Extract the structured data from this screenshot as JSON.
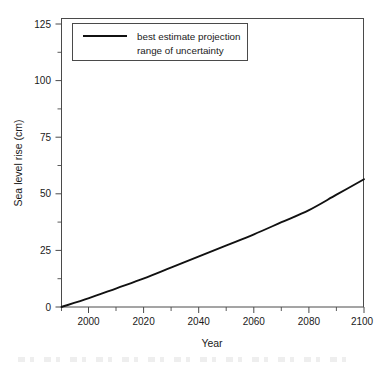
{
  "figure": {
    "background_color": "#ffffff",
    "line_color": "#111111",
    "axis_color": "#4a4a4a"
  },
  "chart_data": {
    "type": "line",
    "title": "",
    "xlabel": "Year",
    "ylabel": "Sea level rise (cm)",
    "xlim": [
      1990,
      2100
    ],
    "ylim": [
      0,
      131
    ],
    "grid": false,
    "legend_position": "top-left",
    "x_ticks": [
      2000,
      2020,
      2040,
      2060,
      2080,
      2100
    ],
    "x_tick_labels": [
      "2000",
      "2020",
      "2040",
      "2060",
      "2080",
      "2100"
    ],
    "x_minor_ticks": [
      1990,
      2010,
      2030,
      2050,
      2070,
      2090
    ],
    "y_ticks": [
      0,
      25,
      50,
      75,
      100,
      125
    ],
    "y_tick_labels": [
      "0",
      "25",
      "50",
      "75",
      "100",
      "125"
    ],
    "y_minor_ticks": [
      12.5,
      37.5,
      62.5,
      87.5,
      112.5
    ],
    "series": [
      {
        "name": "best estimate projection",
        "style": "line",
        "color": "#111111",
        "x": [
          1990,
          2000,
          2010,
          2020,
          2030,
          2040,
          2050,
          2060,
          2070,
          2080,
          2090,
          2100
        ],
        "values": [
          0,
          4,
          8.5,
          13,
          18,
          23,
          28,
          33,
          38.5,
          44,
          51,
          58
        ]
      },
      {
        "name": "range of uncertainty",
        "style": "band",
        "color": "#111111",
        "x": [],
        "values": []
      }
    ]
  },
  "legend": {
    "entries": [
      {
        "label": "best estimate projection",
        "swatch": "line-swatch"
      },
      {
        "label": "range of uncertainty",
        "swatch": "band-swatch"
      }
    ]
  }
}
